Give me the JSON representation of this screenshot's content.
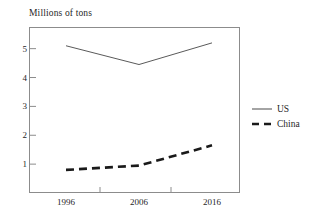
{
  "chart_data": {
    "type": "line",
    "title": "",
    "subtitle": "",
    "xlabel": "",
    "ylabel": "Millions of tons",
    "x": [
      1996,
      2006,
      2016
    ],
    "categories": [
      "1996",
      "2006",
      "2016"
    ],
    "series": [
      {
        "name": "US",
        "values": [
          5.1,
          4.45,
          5.2
        ],
        "style": "solid",
        "color": "#5a5a5a",
        "width": 1
      },
      {
        "name": "China",
        "values": [
          0.8,
          0.95,
          1.65
        ],
        "style": "dashed",
        "color": "#1a1a1a",
        "width": 2.6
      }
    ],
    "ylim": [
      0,
      5.75
    ],
    "yticks": [
      1,
      2,
      3,
      4,
      5
    ],
    "ytick_labels": [
      "1",
      "2",
      "3",
      "4",
      "5"
    ],
    "xlim": [
      1991,
      2021
    ],
    "xtick_labels": [
      "1996",
      "2006",
      "2016"
    ],
    "grid": false,
    "legend_position": "right"
  },
  "axis": {
    "title": "Millions of tons",
    "frame_color": "#8c8c8c"
  },
  "legend": {
    "entries": [
      {
        "label": "US",
        "icon": "solid-line-swatch"
      },
      {
        "label": "China",
        "icon": "dashed-line-swatch"
      }
    ]
  }
}
